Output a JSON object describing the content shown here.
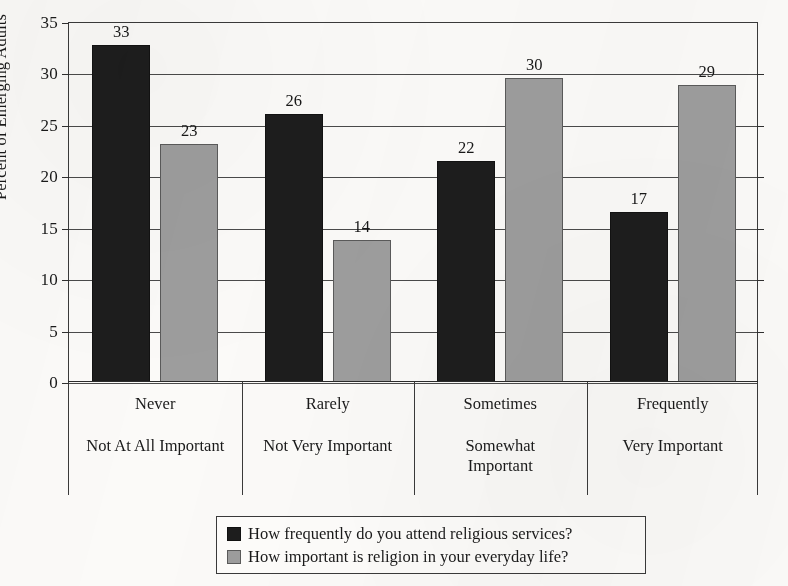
{
  "chart_data": {
    "type": "bar",
    "title": "",
    "xlabel": "",
    "ylabel": "Percent of Emerging Adults",
    "ylim": [
      0,
      35
    ],
    "ytick_step": 5,
    "yticks": [
      "35",
      "30",
      "25",
      "20",
      "15",
      "10",
      "5",
      "0"
    ],
    "grid": true,
    "legend_position": "bottom-center",
    "categories": [
      "Never",
      "Rarely",
      "Sometimes",
      "Frequently"
    ],
    "categories_secondary": [
      "Not At All Important",
      "Not Very Important",
      "Somewhat Important",
      "Very Important"
    ],
    "series": [
      {
        "name": "How frequently do you attend religious services?",
        "color": "#1d1d1d",
        "labels": [
          "33",
          "26",
          "22",
          "17"
        ],
        "values": [
          32.8,
          26.1,
          21.5,
          16.5
        ]
      },
      {
        "name": "How important is religion in your everyday life?",
        "color": "#9d9d9d",
        "labels": [
          "23",
          "14",
          "30",
          "29"
        ],
        "values": [
          23.1,
          13.8,
          29.6,
          28.9
        ]
      }
    ]
  },
  "axis": {
    "y_title": "Percent of Emerging Adults"
  },
  "legend": {
    "items": [
      {
        "swatch": "dark",
        "label": "How frequently do you attend religious services?"
      },
      {
        "swatch": "light",
        "label": "How important is religion in your everyday life?"
      }
    ]
  },
  "colors": {
    "series_dark": "#1d1d1d",
    "series_light": "#9d9d9d",
    "axis": "#3a3a3a",
    "text": "#1a1a1a",
    "background": "#fbfaf8"
  }
}
